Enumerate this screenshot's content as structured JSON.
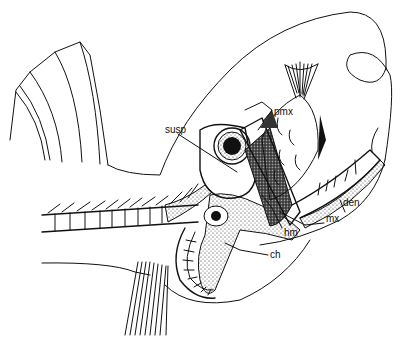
{
  "figure": {
    "labels": {
      "pmx": "pmx",
      "susp": "susp",
      "den": "den",
      "mx": "mx",
      "hm": "hm",
      "ch": "ch"
    }
  }
}
